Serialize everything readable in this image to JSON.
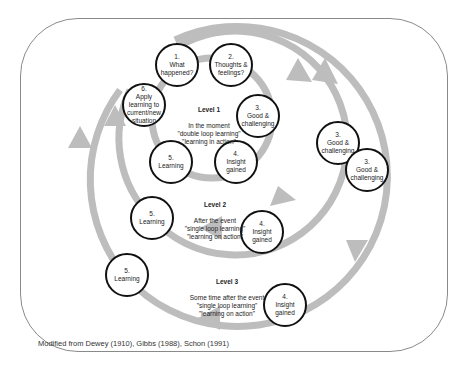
{
  "diagram": {
    "caption": "Modified from Dewey (1910), Gibbs (1988), Schon (1991)",
    "colors": {
      "ring": "#bdbdbd",
      "node_border": "#111111",
      "frame": "#8a8a8a"
    },
    "levels": [
      {
        "name": "Level 1",
        "lines": "In the moment\n\"double loop learning\"\n\"learning in action\"",
        "nodes": [
          {
            "id": "l1-1",
            "text": "1.\nWhat\nhappened?"
          },
          {
            "id": "l1-2",
            "text": "2.\nThoughts &\nfeelings?"
          },
          {
            "id": "l1-3",
            "text": "3.\nGood &\nchallenging"
          },
          {
            "id": "l1-4",
            "text": "4.\nInsight\ngained"
          },
          {
            "id": "l1-5",
            "text": "5.\nLearning"
          },
          {
            "id": "l1-6",
            "text": "6.\nApply\nlearning to\ncurrent/new\nsituation"
          }
        ]
      },
      {
        "name": "Level 2",
        "lines": "After the event\n\"single loop learning\"\n\"learning on action\"",
        "nodes": [
          {
            "id": "l2-3",
            "text": "3.\nGood &\nchallenging"
          },
          {
            "id": "l2-4",
            "text": "4.\nInsight\ngained"
          },
          {
            "id": "l2-5",
            "text": "5.\nLearning"
          }
        ]
      },
      {
        "name": "Level 3",
        "lines": "Some time after the event\n\"single loop learning\"\n\"learning on action\"",
        "nodes": [
          {
            "id": "l3-3",
            "text": "3.\nGood &\nchallenging"
          },
          {
            "id": "l3-4",
            "text": "4.\nInsight\ngained"
          },
          {
            "id": "l3-5",
            "text": "5.\nLearning"
          }
        ]
      }
    ]
  }
}
